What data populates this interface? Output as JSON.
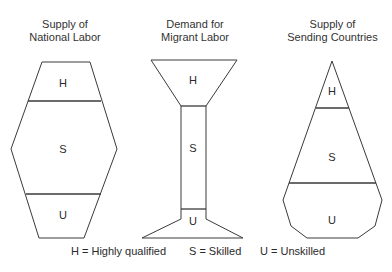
{
  "diagram": {
    "panels": [
      {
        "title_line1": "Supply of",
        "title_line2": "National Labor",
        "shape": "hexagon",
        "segments": [
          {
            "label": "H",
            "meaning": "Highly qualified"
          },
          {
            "label": "S",
            "meaning": "Skilled"
          },
          {
            "label": "U",
            "meaning": "Unskilled"
          }
        ]
      },
      {
        "title_line1": "Demand for",
        "title_line2": "Migrant Labor",
        "shape": "hourglass-column",
        "segments": [
          {
            "label": "H",
            "meaning": "Highly qualified"
          },
          {
            "label": "S",
            "meaning": "Skilled"
          },
          {
            "label": "U",
            "meaning": "Unskilled"
          }
        ]
      },
      {
        "title_line1": "Supply of",
        "title_line2": "Sending Countries",
        "shape": "pyramid",
        "segments": [
          {
            "label": "H",
            "meaning": "Highly qualified"
          },
          {
            "label": "S",
            "meaning": "Skilled"
          },
          {
            "label": "U",
            "meaning": "Unskilled"
          }
        ]
      }
    ],
    "legend": [
      {
        "text": "H = Highly qualified"
      },
      {
        "text": "S = Skilled"
      },
      {
        "text": "U = Unskilled"
      }
    ],
    "stroke_color": "#3a3a3a"
  }
}
